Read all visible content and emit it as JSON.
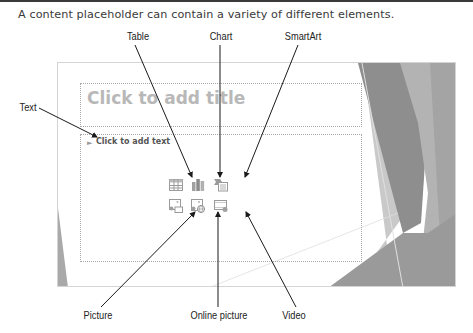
{
  "caption": "A content placeholder can contain a variety of different elements.",
  "callouts": {
    "table": "Table",
    "chart": "Chart",
    "smartart": "SmartArt",
    "text": "Text",
    "picture": "Picture",
    "online_picture": "Online picture",
    "video": "Video"
  },
  "slide": {
    "title_placeholder": "Click to add title",
    "body_placeholder": "Click to add text",
    "bullet": "►",
    "insert_icons": [
      {
        "name": "insert-table-icon",
        "label": "Table"
      },
      {
        "name": "insert-chart-icon",
        "label": "Chart"
      },
      {
        "name": "insert-smartart-icon",
        "label": "SmartArt"
      },
      {
        "name": "insert-picture-icon",
        "label": "Picture"
      },
      {
        "name": "insert-online-picture-icon",
        "label": "Online picture"
      },
      {
        "name": "insert-video-icon",
        "label": "Video"
      }
    ]
  },
  "colors": {
    "rule": "#3a3a3a",
    "deco_dark": "#8c8c8c",
    "deco_mid": "#a6a6a6",
    "deco_light": "#c8c8c8"
  }
}
